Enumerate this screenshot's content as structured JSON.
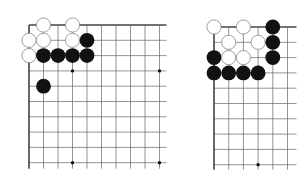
{
  "figure": {
    "colors": {
      "background": "#ffffff",
      "grid": "#666666",
      "edge": "#444444",
      "black_stone": "#111111",
      "white_stone": "#ffffff",
      "white_outline": "#888888"
    }
  },
  "boards": [
    {
      "id": "left",
      "origin": [
        29,
        25
      ],
      "spacing": [
        14.5,
        15.3
      ],
      "cols": 10,
      "rows": 10,
      "extend_right": 7,
      "extend_bottom": 6,
      "edges": [
        "top",
        "left"
      ],
      "star_points": [
        [
          3,
          3
        ],
        [
          9,
          3
        ],
        [
          3,
          9
        ],
        [
          9,
          9
        ]
      ],
      "stones": [
        {
          "color": "white",
          "col": 1,
          "row": 0
        },
        {
          "color": "white",
          "col": 3,
          "row": 0
        },
        {
          "color": "white",
          "col": 0,
          "row": 1
        },
        {
          "color": "white",
          "col": 1,
          "row": 1
        },
        {
          "color": "white",
          "col": 3,
          "row": 1
        },
        {
          "color": "black",
          "col": 4,
          "row": 1
        },
        {
          "color": "white",
          "col": 0,
          "row": 2
        },
        {
          "color": "black",
          "col": 1,
          "row": 2
        },
        {
          "color": "black",
          "col": 2,
          "row": 2
        },
        {
          "color": "black",
          "col": 3,
          "row": 2
        },
        {
          "color": "black",
          "col": 4,
          "row": 2
        },
        {
          "color": "black",
          "col": 1,
          "row": 4
        }
      ]
    },
    {
      "id": "right",
      "origin": [
        214,
        27
      ],
      "spacing": [
        14.7,
        15.3
      ],
      "cols": 6,
      "rows": 10,
      "extend_right": 9,
      "extend_bottom": 5,
      "edges": [
        "top",
        "left"
      ],
      "star_points": [
        [
          3,
          9
        ]
      ],
      "stones": [
        {
          "color": "white",
          "col": 0,
          "row": 0
        },
        {
          "color": "white",
          "col": 2,
          "row": 0
        },
        {
          "color": "black",
          "col": 4,
          "row": 0
        },
        {
          "color": "white",
          "col": 1,
          "row": 1
        },
        {
          "color": "white",
          "col": 3,
          "row": 1
        },
        {
          "color": "black",
          "col": 4,
          "row": 1
        },
        {
          "color": "black",
          "col": 0,
          "row": 2
        },
        {
          "color": "white",
          "col": 1,
          "row": 2
        },
        {
          "color": "white",
          "col": 2,
          "row": 2
        },
        {
          "color": "black",
          "col": 4,
          "row": 2
        },
        {
          "color": "black",
          "col": 0,
          "row": 3
        },
        {
          "color": "black",
          "col": 1,
          "row": 3
        },
        {
          "color": "black",
          "col": 2,
          "row": 3
        },
        {
          "color": "black",
          "col": 3,
          "row": 3
        }
      ]
    }
  ]
}
